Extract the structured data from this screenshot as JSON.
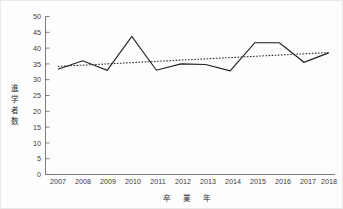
{
  "chart_data": {
    "type": "line",
    "title": "",
    "xlabel": "卒 業 年",
    "ylabel": "進学者数",
    "categories": [
      "2007",
      "2008",
      "2009",
      "2010",
      "2011",
      "2012",
      "2013",
      "2014",
      "2015",
      "2016",
      "2017",
      "2018"
    ],
    "x": [
      2007,
      2008,
      2009,
      2010,
      2011,
      2012,
      2013,
      2014,
      2015,
      2016,
      2017,
      2018
    ],
    "series": [
      {
        "name": "進学者数",
        "style": "solid",
        "color": "#1b1b1b",
        "values": [
          33.3,
          36.0,
          33.0,
          43.7,
          33.0,
          35.0,
          34.8,
          32.8,
          41.7,
          41.7,
          35.5,
          38.5
        ]
      },
      {
        "name": "近似直線",
        "style": "dotted",
        "color": "#262626",
        "values": [
          34.2,
          34.6,
          35.0,
          35.4,
          35.8,
          36.2,
          36.6,
          37.0,
          37.4,
          37.8,
          38.2,
          38.6
        ]
      }
    ],
    "ylim": [
      0,
      50
    ],
    "yticks": [
      0,
      5,
      10,
      15,
      20,
      25,
      30,
      35,
      40,
      45,
      50
    ],
    "ytick_labels": [
      "0",
      "5",
      "10",
      "15",
      "20",
      "25",
      "30",
      "35",
      "40",
      "45",
      "50"
    ],
    "xtick_labels": [
      "2007",
      "2008",
      "2009",
      "2010",
      "2011",
      "2012",
      "2013",
      "2014",
      "2015",
      "2016",
      "2017",
      "2018"
    ],
    "grid": false,
    "legend": "none"
  },
  "axis": {
    "y_title": "進学者数",
    "x_title": "卒 業 年"
  },
  "y_title_chars": [
    "進",
    "学",
    "者",
    "数"
  ],
  "x_title_chars": [
    "卒",
    "業",
    "年"
  ]
}
